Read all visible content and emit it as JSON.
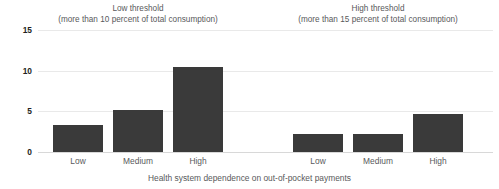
{
  "chart_data": {
    "type": "bar",
    "title": "",
    "xlabel": "Health system dependence on out-of-pocket payments",
    "ylabel": "",
    "ylim": [
      0,
      15
    ],
    "yticks": [
      0,
      5,
      10,
      15
    ],
    "ytick_labels": [
      "0",
      "5",
      "10",
      "15"
    ],
    "grid": true,
    "legend": "none",
    "bar_color": "#3a3a3a",
    "categories": [
      "Low",
      "Medium",
      "High"
    ],
    "panels": [
      {
        "id": "low-threshold",
        "title_line1": "Low threshold",
        "title_line2": "(more than 10 percent of total consumption)",
        "categories": [
          "Low",
          "Medium",
          "High"
        ],
        "values": [
          3.3,
          5.2,
          10.4
        ]
      },
      {
        "id": "high-threshold",
        "title_line1": "High threshold",
        "title_line2": "(more than 15 percent of total consumption)",
        "categories": [
          "Low",
          "Medium",
          "High"
        ],
        "values": [
          2.2,
          2.2,
          4.7
        ]
      }
    ]
  },
  "colors": {
    "bar": "#3a3a3a",
    "gridline": "#e9e9e9",
    "baseline": "#d8d8d8",
    "text": "#58595b",
    "tick_text": "#231f20",
    "background": "#ffffff"
  }
}
